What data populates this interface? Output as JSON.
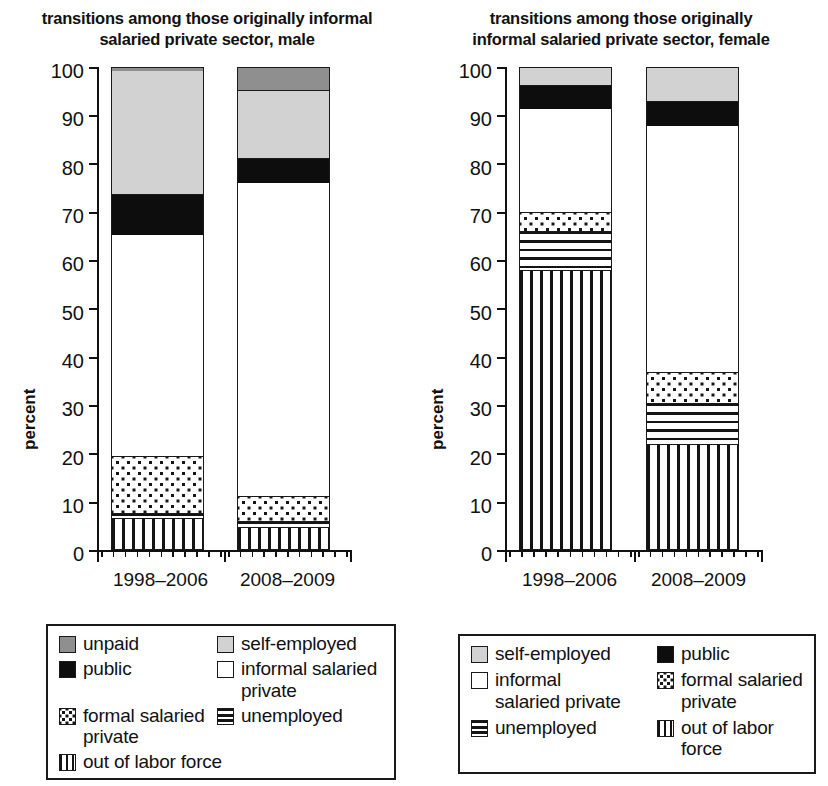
{
  "chart_data": [
    {
      "type": "bar",
      "stacked": true,
      "title": "transitions among those originally informal salaried private sector, male",
      "title_lines": [
        "transitions among those originally informal",
        "salaried private sector, male"
      ],
      "xlabel": "",
      "ylabel": "percent",
      "ylim": [
        0,
        100
      ],
      "yticks": [
        0,
        10,
        20,
        30,
        40,
        50,
        60,
        70,
        80,
        90,
        100
      ],
      "grid": false,
      "legend_position": "below",
      "categories": [
        "1998–2006",
        "2008–2009"
      ],
      "series": [
        {
          "name": "out of labor force",
          "values": [
            6.2,
            4.8
          ]
        },
        {
          "name": "unemployed",
          "values": [
            1.1,
            1.2
          ]
        },
        {
          "name": "formal salaried private",
          "values": [
            11.9,
            5.3
          ]
        },
        {
          "name": "informal salaried private",
          "values": [
            45.9,
            65.0
          ]
        },
        {
          "name": "public",
          "values": [
            8.3,
            5.0
          ]
        },
        {
          "name": "self-employed",
          "values": [
            26.1,
            14.0
          ]
        },
        {
          "name": "unpaid",
          "values": [
            0.5,
            4.7
          ]
        }
      ],
      "cumulative_tops": {
        "1998–2006": [
          6.2,
          7.3,
          19.2,
          65.1,
          73.4,
          99.5,
          100
        ],
        "2008–2009": [
          4.8,
          6.0,
          11.3,
          76.3,
          81.3,
          95.3,
          100
        ]
      },
      "legend": [
        {
          "label": "unpaid",
          "pattern": "unpaid"
        },
        {
          "label": "self-employed",
          "pattern": "selfemp"
        },
        {
          "label": "public",
          "pattern": "public"
        },
        {
          "label": "informal salaried private",
          "pattern": "informal"
        },
        {
          "label": "formal salaried private",
          "pattern": "formal"
        },
        {
          "label": "unemployed",
          "pattern": "unemployed"
        },
        {
          "label": "out of labor force",
          "pattern": "olf"
        }
      ]
    },
    {
      "type": "bar",
      "stacked": true,
      "title": "transitions among those originally informal salaried private sector, female",
      "title_lines": [
        "transitions among those originally",
        "informal salaried private sector, female"
      ],
      "xlabel": "",
      "ylabel": "percent",
      "ylim": [
        0,
        100
      ],
      "yticks": [
        0,
        10,
        20,
        30,
        40,
        50,
        60,
        70,
        80,
        90,
        100
      ],
      "grid": false,
      "legend_position": "below",
      "categories": [
        "1998–2006",
        "2008–2009"
      ],
      "series": [
        {
          "name": "out of labor force",
          "values": [
            58.0,
            22.0
          ]
        },
        {
          "name": "unemployed",
          "values": [
            8.0,
            8.5
          ]
        },
        {
          "name": "formal salaried private",
          "values": [
            4.0,
            6.5
          ]
        },
        {
          "name": "informal salaried private",
          "values": [
            21.5,
            51.0
          ]
        },
        {
          "name": "public",
          "values": [
            4.8,
            5.0
          ]
        },
        {
          "name": "self-employed",
          "values": [
            3.7,
            7.0
          ]
        }
      ],
      "cumulative_tops": {
        "1998–2006": [
          58.0,
          66.0,
          70.0,
          91.5,
          96.3,
          100
        ],
        "2008–2009": [
          22.0,
          30.5,
          37.0,
          88.0,
          93.0,
          100
        ]
      },
      "legend": [
        {
          "label": "self-employed",
          "pattern": "selfemp"
        },
        {
          "label": "public",
          "pattern": "public"
        },
        {
          "label": "informal salaried private",
          "pattern": "informal"
        },
        {
          "label": "formal salaried private",
          "pattern": "formal"
        },
        {
          "label": "unemployed",
          "pattern": "unemployed"
        },
        {
          "label": "out of labor force",
          "pattern": "olf"
        }
      ]
    }
  ],
  "left": {
    "title_line1": "transitions among those originally informal",
    "title_line2": "salaried private sector, male",
    "ylabel": "percent",
    "yticks": [
      "100",
      "90",
      "80",
      "70",
      "60",
      "50",
      "40",
      "30",
      "20",
      "10",
      "0"
    ],
    "categories": [
      "1998–2006",
      "2008–2009"
    ],
    "legend": {
      "unpaid": "unpaid",
      "self_employed": "self-employed",
      "public": "public",
      "informal": "informal salaried private",
      "informal_l1": "informal salaried",
      "informal_l2": "private",
      "formal_l1": "formal salaried",
      "formal_l2": "private",
      "unemployed": "unemployed",
      "olf": "out of labor force"
    }
  },
  "right": {
    "title_line1": "transitions among those originally",
    "title_line2": "informal salaried private sector, female",
    "ylabel": "percent",
    "yticks": [
      "100",
      "90",
      "80",
      "70",
      "60",
      "50",
      "40",
      "30",
      "20",
      "10",
      "0"
    ],
    "categories": [
      "1998–2006",
      "2008–2009"
    ],
    "legend": {
      "self_employed": "self-employed",
      "public": "public",
      "informal_l1": "informal",
      "informal_l2": "salaried private",
      "formal_l1": "formal salaried",
      "formal_l2": "private",
      "unemployed": "unemployed",
      "olf_l1": "out of labor",
      "olf_l2": "force"
    }
  },
  "colors": {
    "unpaid": "#8f8f8f",
    "self_employed": "#d2d2d2",
    "public": "#0d0d0d",
    "informal": "#ffffff",
    "outline": "#1a1a1a"
  }
}
